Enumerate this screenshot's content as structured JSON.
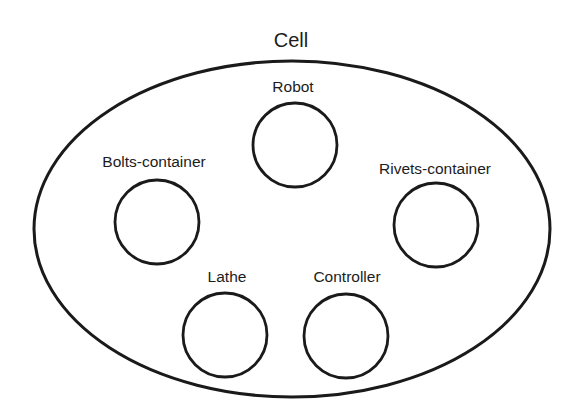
{
  "diagram": {
    "title": "Cell",
    "container": {
      "label": "Cell",
      "shape": "ellipse",
      "cx": 292,
      "cy": 229,
      "rx": 258,
      "ry": 168
    },
    "nodes": [
      {
        "id": "robot",
        "label": "Robot",
        "cx": 295,
        "cy": 145,
        "r": 42,
        "label_x": 293,
        "label_y": 88
      },
      {
        "id": "bolts-container",
        "label": "Bolts-container",
        "cx": 157,
        "cy": 222,
        "r": 42,
        "label_x": 154,
        "label_y": 163
      },
      {
        "id": "rivets-container",
        "label": "Rivets-container",
        "cx": 436,
        "cy": 225,
        "r": 42,
        "label_x": 435,
        "label_y": 170
      },
      {
        "id": "lathe",
        "label": "Lathe",
        "cx": 225,
        "cy": 335,
        "r": 42,
        "label_x": 227,
        "label_y": 278
      },
      {
        "id": "controller",
        "label": "Controller",
        "cx": 346,
        "cy": 336,
        "r": 42,
        "label_x": 347,
        "label_y": 278
      }
    ],
    "colors": {
      "stroke": "#1a1a1a",
      "text": "#1c1c1c",
      "background": "#ffffff"
    }
  }
}
